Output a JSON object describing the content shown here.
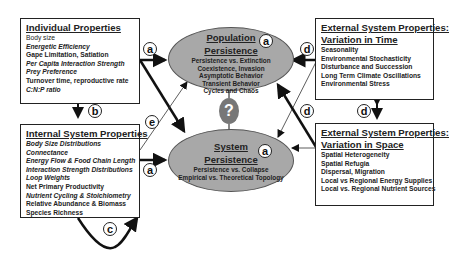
{
  "individual": {
    "title": "Individual Properties",
    "items": [
      {
        "text": "Body size",
        "style": "normal"
      },
      {
        "text": "Energetic Efficiency",
        "style": "italic"
      },
      {
        "text": "Gape Limitation, Satiation",
        "style": "bold"
      },
      {
        "text": "Per Capita Interaction Strength",
        "style": "italic"
      },
      {
        "text": "Prey Preference",
        "style": "italic"
      },
      {
        "text": "Turnover time, reproductive rate",
        "style": "bold"
      },
      {
        "text": "C:N:P ratio",
        "style": "italic"
      }
    ]
  },
  "internal": {
    "title": "Internal System Properties",
    "items": [
      {
        "text": "Body Size Distributions",
        "style": "italic"
      },
      {
        "text": "Connectance",
        "style": "italic"
      },
      {
        "text": "Energy Flow & Food Chain Length",
        "style": "italic"
      },
      {
        "text": "Interaction Strength Distributions",
        "style": "italic"
      },
      {
        "text": "Loop Weights",
        "style": "italic"
      },
      {
        "text": "Net Primary Productivity",
        "style": "bold"
      },
      {
        "text": "Nutrient Cycling & Stoichiometry",
        "style": "italic"
      },
      {
        "text": "Relative Abundance & Biomass",
        "style": "bold"
      },
      {
        "text": "Species Richness",
        "style": "bold"
      }
    ]
  },
  "time": {
    "title1": "External System Properties:",
    "title2": "Variation in Time",
    "items": [
      "Seasonality",
      "Environmental Stochasticity",
      "Disturbance and Succession",
      "Long Term Climate Oscillations",
      "Environmental Stress"
    ]
  },
  "space": {
    "title1": "External System Properties:",
    "title2": "Variation in Space",
    "items": [
      "Spatial Heterogeneity",
      "Spatial  Refugia",
      "Dispersal, Migration",
      "Local vs Regional Energy Supplies",
      "Local vs. Regional Nutrient Sources"
    ]
  },
  "population": {
    "title1": "Population",
    "title2": "Persistence",
    "items": [
      "Persistence vs. Extinction",
      "Coexistence, Invasion",
      "Asymptotic Behavior",
      "Transient Behavior",
      "Cycles and Chaos"
    ]
  },
  "system": {
    "title1": "System",
    "title2": "Persistence",
    "items": [
      "Persistence vs. Collapse",
      "Empirical vs. Theoretical Topology"
    ]
  },
  "badges": {
    "a": "a",
    "b": "b",
    "c": "c",
    "d": "d",
    "e": "e"
  },
  "question_mark": "?"
}
